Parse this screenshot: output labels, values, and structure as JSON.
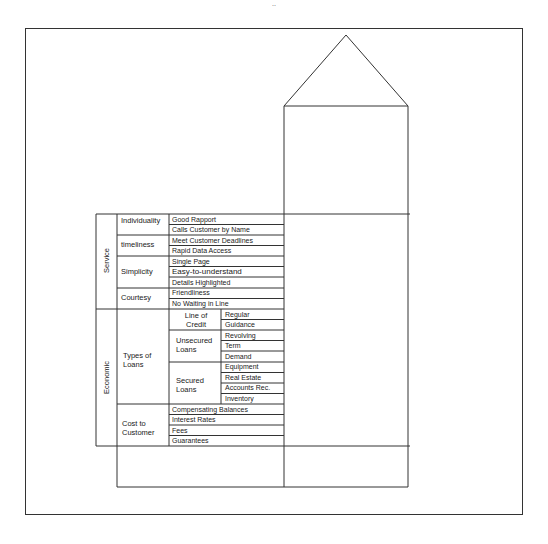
{
  "diagram": {
    "header_fragment": "..",
    "colors": {
      "line": "#333333",
      "text": "#1a1a1a",
      "background": "#ffffff"
    },
    "sections": [
      {
        "label": "Service",
        "categories": [
          {
            "label": "Individuality",
            "items": [
              "Good Rapport",
              "Calls Customer by Name"
            ]
          },
          {
            "label": "timeliness",
            "items": [
              "Meet Customer Deadlines",
              "Rapid Data Access"
            ]
          },
          {
            "label": "Simplicity",
            "items": [
              "Single Page",
              "Easy-to-understand",
              "Details Highlighted"
            ]
          },
          {
            "label": "Courtesy",
            "items": [
              "Friendliness",
              "No Waiting in Line"
            ]
          }
        ]
      },
      {
        "label": "Economic",
        "categories": [
          {
            "label": "Types of Loans",
            "subcategories": [
              {
                "label": "Line of Credit",
                "items": [
                  "Regular",
                  "Guidance"
                ]
              },
              {
                "label": "Unsecured Loans",
                "items": [
                  "Revolving",
                  "Term",
                  "Demand"
                ]
              },
              {
                "label": "Secured Loans",
                "items": [
                  "Equipment",
                  "Real Estate",
                  "Accounts Rec.",
                  "Inventory"
                ]
              }
            ]
          },
          {
            "label": "Cost to Customer",
            "items": [
              "Compensating Balances",
              "Interest Rates",
              "Fees",
              "Guarantees"
            ]
          }
        ]
      }
    ]
  }
}
